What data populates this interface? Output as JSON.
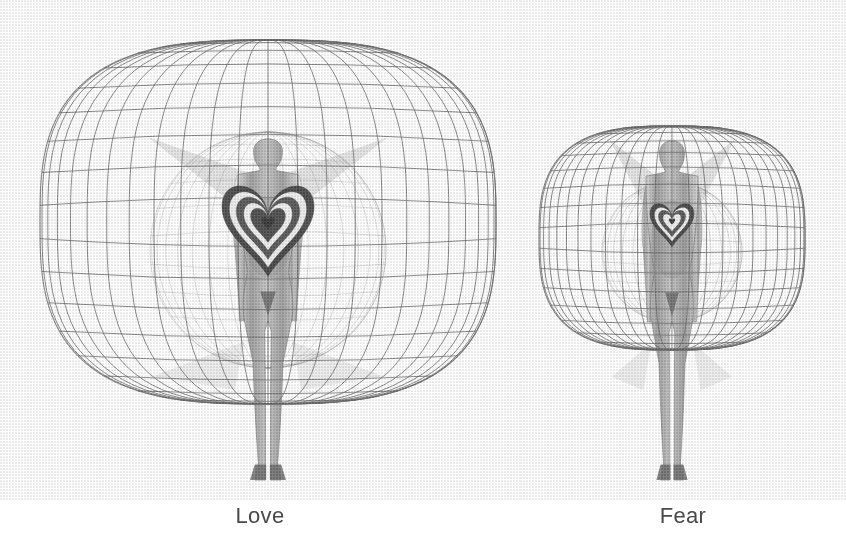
{
  "page": {
    "background_color": "#ffffff",
    "width": 846,
    "height": 560
  },
  "figures": [
    {
      "id": "love",
      "caption": "Love",
      "description": "Human figure with a large expanded wireframe mesh aura sphere and concentric heart at the chest",
      "aura": {
        "type": "wireframe-sphere",
        "center_x": 268,
        "center_y": 222,
        "radius_x": 228,
        "radius_y": 182,
        "color": "#5a5a5a",
        "meridians": 24,
        "parallels": 17,
        "relative_size": "large"
      },
      "inner_aura": {
        "type": "wireframe-sphere",
        "center_x": 268,
        "center_y": 250,
        "radius_x": 118,
        "radius_y": 118,
        "color": "#8a8a8a",
        "meridians": 18,
        "parallels": 13
      },
      "heart": {
        "center_x": 268,
        "center_y": 222,
        "width": 92,
        "rings": 5,
        "ring_colors": [
          "#2e2e2e",
          "#f2f2f2",
          "#3a3a3a",
          "#f2f2f2",
          "#2e2e2e"
        ]
      },
      "body": {
        "head_center_x": 268,
        "head_top_y": 134,
        "foot_y": 480,
        "height": 346,
        "shoulder_width": 60,
        "color": "#8d8d8d"
      },
      "wings": {
        "visible": true,
        "span": 230,
        "color": "#6e6e6e"
      }
    },
    {
      "id": "fear",
      "caption": "Fear",
      "description": "Human figure with a small contracted wireframe mesh aura sphere and smaller concentric heart at the chest",
      "aura": {
        "type": "wireframe-sphere",
        "center_x": 152,
        "center_y": 238,
        "radius_x": 133,
        "radius_y": 112,
        "color": "#5a5a5a",
        "meridians": 24,
        "parallels": 17,
        "relative_size": "small"
      },
      "inner_aura": {
        "type": "wireframe-sphere",
        "center_x": 152,
        "center_y": 252,
        "radius_x": 70,
        "radius_y": 70,
        "color": "#8a8a8a",
        "meridians": 16,
        "parallels": 11
      },
      "heart": {
        "center_x": 152,
        "center_y": 221,
        "width": 44,
        "rings": 4,
        "ring_colors": [
          "#2e2e2e",
          "#f2f2f2",
          "#3a3a3a",
          "#f2f2f2"
        ]
      },
      "body": {
        "head_center_x": 152,
        "head_top_y": 136,
        "foot_y": 480,
        "height": 344,
        "shoulder_width": 52,
        "color": "#8d8d8d"
      },
      "wings": {
        "visible": true,
        "span": 120,
        "color": "#6e6e6e"
      }
    }
  ],
  "caption_style": {
    "color": "#4a4a4a",
    "font_size_px": 22
  }
}
